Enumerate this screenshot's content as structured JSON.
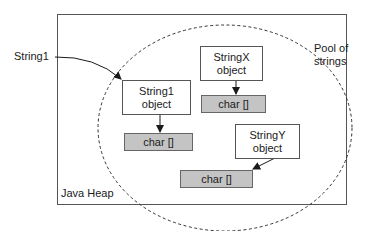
{
  "diagram": {
    "heap": {
      "label": "Java Heap"
    },
    "pool": {
      "label_line1": "Pool of",
      "label_line2": "strings"
    },
    "external_reference": {
      "label": "String1"
    },
    "objects": [
      {
        "name": "String1",
        "line1": "String1",
        "line2": "object",
        "array_label": "char []"
      },
      {
        "name": "StringX",
        "line1": "StringX",
        "line2": "object",
        "array_label": "char []"
      },
      {
        "name": "StringY",
        "line1": "StringY",
        "line2": "object",
        "array_label": "char []"
      }
    ],
    "colors": {
      "border": "#555555",
      "array_fill": "#c4c4c4",
      "object_fill": "#ffffff",
      "arrow": "#1a1a1a"
    }
  }
}
